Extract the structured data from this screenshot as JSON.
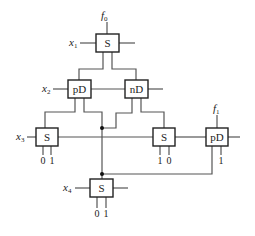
{
  "diagram": {
    "nodes": {
      "s_top": {
        "label": "S"
      },
      "pd_left": {
        "label": "pD"
      },
      "nd_mid": {
        "label": "nD"
      },
      "s_left": {
        "label": "S"
      },
      "s_right": {
        "label": "S"
      },
      "pd_right": {
        "label": "pD"
      },
      "s_bottom": {
        "label": "S"
      }
    },
    "inputs": {
      "x1": {
        "var": "x",
        "sub": "1"
      },
      "x2": {
        "var": "x",
        "sub": "2"
      },
      "x3": {
        "var": "x",
        "sub": "3"
      },
      "x4": {
        "var": "x",
        "sub": "4"
      }
    },
    "outputs": {
      "f0": {
        "var": "f",
        "sub": "0"
      },
      "f1": {
        "var": "f",
        "sub": "1"
      }
    },
    "terminals": {
      "s_left_a": "0",
      "s_left_b": "1",
      "s_right_a": "1",
      "s_right_b": "0",
      "pd_right_a": "1",
      "s_bottom_a": "0",
      "s_bottom_b": "1"
    }
  }
}
